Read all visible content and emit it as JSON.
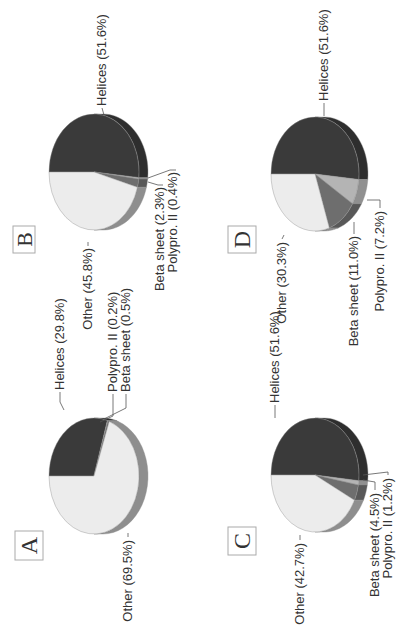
{
  "figure": {
    "orientation": "rotated-90-ccw",
    "colors": {
      "helices": "#3a3a3a",
      "other": "#ececec",
      "beta_sheet": "#6e6e6e",
      "polypro": "#b4b4b4",
      "edge": "#8a8a8a",
      "box_border": "#aaaaaa",
      "leader": "#555555"
    }
  },
  "chart_data": [
    {
      "type": "pie",
      "panel": "A",
      "slices": [
        {
          "label": "Helices",
          "value": 29.8,
          "text": "Helices (29.8%)"
        },
        {
          "label": "Polypro. II",
          "value": 0.2,
          "text": "Polypro. II (0.2%)"
        },
        {
          "label": "Beta sheet",
          "value": 0.5,
          "text": "Beta sheet (0.5%)"
        },
        {
          "label": "Other",
          "value": 69.5,
          "text": "Other (69.5%)"
        }
      ]
    },
    {
      "type": "pie",
      "panel": "B",
      "slices": [
        {
          "label": "Helices",
          "value": 51.6,
          "text": "Helices (51.6%)"
        },
        {
          "label": "Polypro. II",
          "value": 0.4,
          "text": "Polypro. II (0.4%)"
        },
        {
          "label": "Beta sheet",
          "value": 2.3,
          "text": "Beta sheet (2.3%)"
        },
        {
          "label": "Other",
          "value": 45.8,
          "text": "Other (45.8%)"
        }
      ]
    },
    {
      "type": "pie",
      "panel": "C",
      "slices": [
        {
          "label": "Helices",
          "value": 51.6,
          "text": "Helices (51.6%)"
        },
        {
          "label": "Polypro. II",
          "value": 1.2,
          "text": "Polypro. II (1.2%)"
        },
        {
          "label": "Beta sheet",
          "value": 4.5,
          "text": "Beta sheet (4.5%)"
        },
        {
          "label": "Other",
          "value": 42.7,
          "text": "Other (42.7%)"
        }
      ]
    },
    {
      "type": "pie",
      "panel": "D",
      "slices": [
        {
          "label": "Helices",
          "value": 51.6,
          "text": "Helices (51.6%)"
        },
        {
          "label": "Polypro. II",
          "value": 7.2,
          "text": "Polypro. II (7.2%)"
        },
        {
          "label": "Beta sheet",
          "value": 11.0,
          "text": "Beta sheet (11.0%)"
        },
        {
          "label": "Other",
          "value": 30.3,
          "text": "Other (30.3%)"
        }
      ]
    }
  ],
  "panels": {
    "A": {
      "letter": "A"
    },
    "B": {
      "letter": "B"
    },
    "C": {
      "letter": "C"
    },
    "D": {
      "letter": "D"
    }
  }
}
